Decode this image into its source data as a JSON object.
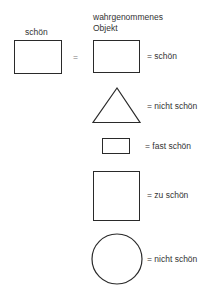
{
  "diagram": {
    "left_label": "schön",
    "equals": "=",
    "perceived_header_line1": "wahrgenommenes",
    "perceived_header_line2": "Objekt",
    "rows": [
      {
        "shape": "rectangle",
        "label": "= schön"
      },
      {
        "shape": "triangle",
        "label": "= nicht schön"
      },
      {
        "shape": "small-rectangle",
        "label": "= fast schön"
      },
      {
        "shape": "square",
        "label": "= zu schön"
      },
      {
        "shape": "circle",
        "label": "= nicht schön"
      }
    ]
  }
}
